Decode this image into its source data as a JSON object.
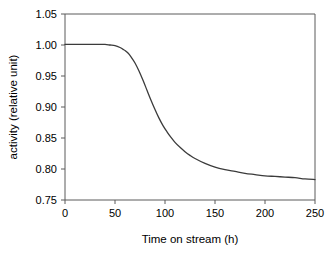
{
  "chart_data": {
    "type": "line",
    "title": "",
    "xlabel": "Time on stream (h)",
    "ylabel": "activity (relative unit)",
    "xlim": [
      0,
      250
    ],
    "ylim": [
      0.75,
      1.05
    ],
    "xticks": [
      0,
      50,
      100,
      150,
      200,
      250
    ],
    "yticks": [
      0.75,
      0.8,
      0.85,
      0.9,
      0.95,
      1.0,
      1.05
    ],
    "xtick_labels": [
      "0",
      "50",
      "100",
      "150",
      "200",
      "250"
    ],
    "ytick_labels": [
      "0.75",
      "0.80",
      "0.85",
      "0.90",
      "0.95",
      "1.00",
      "1.05"
    ],
    "grid": false,
    "legend": null,
    "legend_position": "none",
    "line_color": "#3b3b3b",
    "axis_color": "#5a5a5a",
    "background_color": "#ffffff",
    "series": [
      {
        "name": "activity",
        "x": [
          0,
          10,
          20,
          30,
          40,
          45,
          50,
          55,
          58,
          60,
          63,
          66,
          70,
          74,
          78,
          82,
          86,
          90,
          94,
          98,
          102,
          106,
          110,
          115,
          120,
          125,
          130,
          140,
          150,
          160,
          170,
          180,
          190,
          200,
          210,
          220,
          230,
          240,
          250
        ],
        "y": [
          1.001,
          1.001,
          1.001,
          1.001,
          1.001,
          1.0,
          0.999,
          0.996,
          0.993,
          0.991,
          0.987,
          0.981,
          0.971,
          0.958,
          0.943,
          0.927,
          0.911,
          0.896,
          0.882,
          0.87,
          0.86,
          0.851,
          0.843,
          0.835,
          0.828,
          0.822,
          0.817,
          0.809,
          0.803,
          0.799,
          0.796,
          0.793,
          0.791,
          0.789,
          0.788,
          0.787,
          0.786,
          0.784,
          0.783
        ]
      }
    ]
  }
}
